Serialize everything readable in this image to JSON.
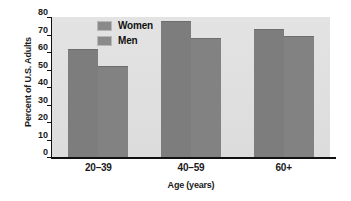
{
  "chart_data": {
    "type": "bar",
    "title": "",
    "subtitle": "",
    "xlabel": "Age (years)",
    "ylabel": "Percent of U.S. Adults",
    "categories": [
      "20–39",
      "40–59",
      "60+"
    ],
    "series": [
      {
        "name": "Women",
        "values": [
          62,
          78,
          73
        ],
        "color": "#7d7d7d"
      },
      {
        "name": "Men",
        "values": [
          52,
          68,
          69
        ],
        "color": "#828282"
      }
    ],
    "ylim": [
      0,
      80
    ],
    "ytick_values": [
      0,
      10,
      20,
      30,
      40,
      50,
      60,
      70,
      80
    ],
    "ytick_labels": [
      "0",
      "10",
      "20",
      "30",
      "40",
      "50",
      "60",
      "70",
      "80"
    ],
    "grid": false,
    "legend_position": "upper-left-inside",
    "plot_background": "#e0e0e0",
    "figure_background": "#ffffff",
    "axis_color": "#111111"
  }
}
